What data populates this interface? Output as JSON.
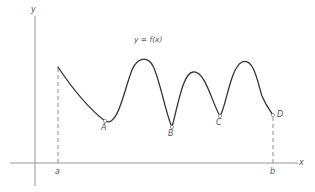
{
  "diagram": {
    "function_label": "y = f(x)",
    "axes": {
      "x_label": "x",
      "y_label": "y",
      "color": "#8a8a8a"
    },
    "curve_color": "#333333",
    "dashed_color": "#8a8a8a",
    "interval": {
      "start_label": "a",
      "end_label": "b"
    },
    "points": [
      {
        "label": "A",
        "description": "local minimum"
      },
      {
        "label": "B",
        "description": "local minimum"
      },
      {
        "label": "C",
        "description": "local minimum"
      },
      {
        "label": "D",
        "description": "endpoint at b"
      }
    ]
  }
}
